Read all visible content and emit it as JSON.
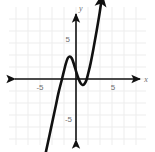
{
  "chart_data": {
    "type": "line",
    "title": "",
    "xlabel": "x",
    "ylabel": "y",
    "xlim": [
      -7,
      7
    ],
    "ylim": [
      -7,
      7
    ],
    "grid": true,
    "legend": null,
    "x_tick_labels": [
      "-5",
      "5"
    ],
    "y_tick_labels": [
      "5",
      "-5"
    ],
    "x_ticks": [
      -5,
      5
    ],
    "y_ticks": [
      5,
      -5
    ],
    "series": [
      {
        "name": "cubic-curve",
        "color": "#111111",
        "arrow_start": true,
        "arrow_end": true,
        "points": [
          [
            -2.6,
            -6.6
          ],
          [
            -2.3,
            -5.2
          ],
          [
            -2.0,
            -3.8
          ],
          [
            -1.7,
            -2.4
          ],
          [
            -1.45,
            -1.2
          ],
          [
            -1.2,
            -0.2
          ],
          [
            -1.0,
            0.6
          ],
          [
            -0.85,
            1.2
          ],
          [
            -0.68,
            1.7
          ],
          [
            -0.52,
            1.85
          ],
          [
            -0.35,
            1.7
          ],
          [
            -0.18,
            1.25
          ],
          [
            0.0,
            0.65
          ],
          [
            0.18,
            0.1
          ],
          [
            0.35,
            -0.3
          ],
          [
            0.52,
            -0.48
          ],
          [
            0.68,
            -0.42
          ],
          [
            0.85,
            -0.1
          ],
          [
            1.0,
            0.45
          ],
          [
            1.2,
            1.3
          ],
          [
            1.45,
            2.6
          ],
          [
            1.7,
            4.0
          ],
          [
            1.95,
            5.5
          ],
          [
            2.15,
            6.9
          ]
        ],
        "features": {
          "local_max": [
            -0.5,
            1.85
          ],
          "local_min": [
            0.55,
            -0.48
          ],
          "end_behavior": "down-left, up-right"
        }
      }
    ],
    "axes": {
      "x_axis_arrows": "both",
      "y_axis_arrows": "both",
      "origin_label": "",
      "axis_color": "#111111",
      "grid_color": "#ebebeb"
    }
  },
  "labels": {
    "x_neg5": "-5",
    "x_pos5": "5",
    "y_pos5": "5",
    "y_neg5": "-5",
    "x_axis_name": "x",
    "y_axis_name": "y"
  }
}
